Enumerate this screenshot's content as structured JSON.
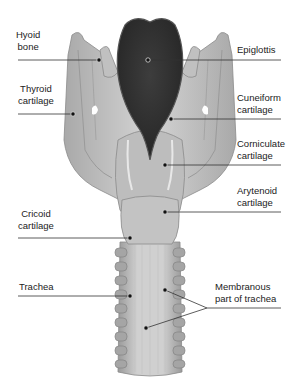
{
  "diagram": {
    "title": "",
    "view": "Larynx, posterior view",
    "colors": {
      "cartilage_light": "#cfcfcf",
      "cartilage_mid": "#b3b3b3",
      "cartilage_dark": "#8e8e8e",
      "epiglottis": "#3a3a3a",
      "leader_line": "#333333",
      "text": "#222222",
      "background": "#ffffff"
    },
    "labels": {
      "hyoid": [
        "Hyoid",
        "bone"
      ],
      "thyroid": [
        "Thyroid",
        "cartilage"
      ],
      "cricoid": [
        "Cricoid",
        "cartilage"
      ],
      "trachea": [
        "Trachea"
      ],
      "epiglottis": [
        "Epiglottis"
      ],
      "cuneiform": [
        "Cuneiform",
        "cartilage"
      ],
      "corniculate": [
        "Corniculate",
        "cartilage"
      ],
      "arytenoid": [
        "Arytenoid",
        "cartilage"
      ],
      "membranous": [
        "Membranous",
        "part of trachea"
      ]
    }
  }
}
